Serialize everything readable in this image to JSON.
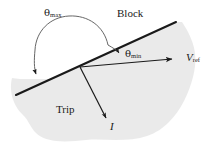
{
  "figure": {
    "background_color": "#ffffff",
    "shaded_region_color": "#e9e9e9",
    "line_color": "#1a1a1a",
    "labels": {
      "block_region": "Block",
      "trip_region": "Trip",
      "theta_max_symbol": "θ",
      "theta_max_sub": "max",
      "theta_min_symbol": "θ",
      "theta_min_sub": "min",
      "v_ref_symbol": "V",
      "v_ref_sub": "ref",
      "current_vector": "I"
    },
    "elements": {
      "boundary_line": "diagonal-characteristic-line",
      "reference_vector": "v-ref-arrow",
      "current_vector": "i-arrow",
      "theta_max_arc": "theta-max-arc-arrow",
      "theta_min_arc": "theta-min-arc-arrow"
    }
  }
}
